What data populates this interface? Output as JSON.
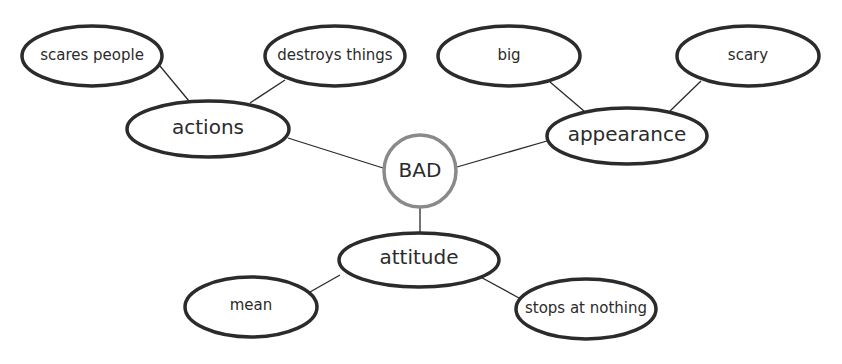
{
  "diagram": {
    "type": "mind-map",
    "center": {
      "label": "BAD",
      "stroke": "#8a8a8a"
    },
    "branches": [
      {
        "label": "actions",
        "children": [
          "scares people",
          "destroys things"
        ]
      },
      {
        "label": "appearance",
        "children": [
          "big",
          "scary"
        ]
      },
      {
        "label": "attitude",
        "children": [
          "mean",
          "stops at nothing"
        ]
      }
    ],
    "colors": {
      "node_stroke": "#2b2b2b",
      "edge": "#2a2a2a",
      "background": "#ffffff"
    }
  }
}
